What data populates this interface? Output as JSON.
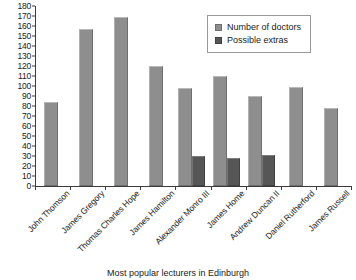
{
  "chart_data": {
    "type": "bar",
    "title": "",
    "caption": "Most popular lecturers in Edinburgh",
    "xlabel": "",
    "ylabel": "",
    "ylim": [
      0,
      180
    ],
    "ytick_step": 10,
    "grid": false,
    "legend_position": "top-right",
    "categories": [
      "John Thomson",
      "James Gregory",
      "Thomas Charles Hope",
      "James Hamilton",
      "Alexander Monro III",
      "James Home",
      "Andrew  Duncan II",
      "Daniel Rutherford",
      "James Russell"
    ],
    "series": [
      {
        "name": "Number of doctors",
        "color": "#8e8e8e",
        "values": [
          84,
          157,
          169,
          120,
          98,
          110,
          90,
          99,
          78
        ]
      },
      {
        "name": "Possible extras",
        "color": "#565656",
        "values": [
          null,
          null,
          null,
          null,
          30,
          28,
          31,
          null,
          null
        ]
      }
    ],
    "ytick_labels": [
      "0",
      "10",
      "20",
      "30",
      "40",
      "50",
      "60",
      "70",
      "80",
      "90",
      "100",
      "110",
      "120",
      "130",
      "140",
      "150",
      "160",
      "170",
      "180"
    ]
  },
  "legend": {
    "items": [
      {
        "label": "Number of doctors",
        "swatch": "primary"
      },
      {
        "label": "Possible extras",
        "swatch": "secondary"
      }
    ]
  }
}
